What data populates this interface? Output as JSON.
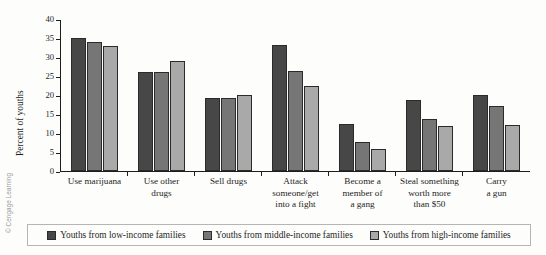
{
  "credit": "© Cengage Learning",
  "legend": {
    "items": [
      {
        "label": "Youths from low-income families",
        "color": "#474747"
      },
      {
        "label": "Youths from middle-income families",
        "color": "#767676"
      },
      {
        "label": "Youths from high-income families",
        "color": "#a9a9a9"
      }
    ]
  },
  "chart_data": {
    "type": "bar",
    "title": "",
    "xlabel": "",
    "ylabel": "Percent of youths",
    "ylim": [
      0,
      40
    ],
    "yticks": [
      0,
      5,
      10,
      15,
      20,
      25,
      30,
      35,
      40
    ],
    "grid": false,
    "legend_position": "bottom",
    "categories": [
      "Use marijuana",
      "Use other drugs",
      "Sell drugs",
      "Attack someone/get into a fight",
      "Become a member of a gang",
      "Steal something worth more than $50",
      "Carry a gun"
    ],
    "category_lines": [
      [
        "Use marijuana"
      ],
      [
        "Use other",
        "drugs"
      ],
      [
        "Sell drugs"
      ],
      [
        "Attack",
        "someone/get",
        "into a fight"
      ],
      [
        "Become a",
        "member of",
        "a gang"
      ],
      [
        "Steal something",
        "worth more",
        "than $50"
      ],
      [
        "Carry",
        "a gun"
      ]
    ],
    "series": [
      {
        "name": "Youths from low-income families",
        "color": "#474747",
        "values": [
          35,
          26,
          19.2,
          33.2,
          12.5,
          18.6,
          20
        ]
      },
      {
        "name": "Youths from middle-income families",
        "color": "#767676",
        "values": [
          34,
          26,
          19.2,
          26.3,
          7.7,
          13.7,
          17
        ]
      },
      {
        "name": "Youths from high-income families",
        "color": "#a9a9a9",
        "values": [
          33,
          28.9,
          20.1,
          22.4,
          5.7,
          11.9,
          12
        ]
      }
    ]
  }
}
